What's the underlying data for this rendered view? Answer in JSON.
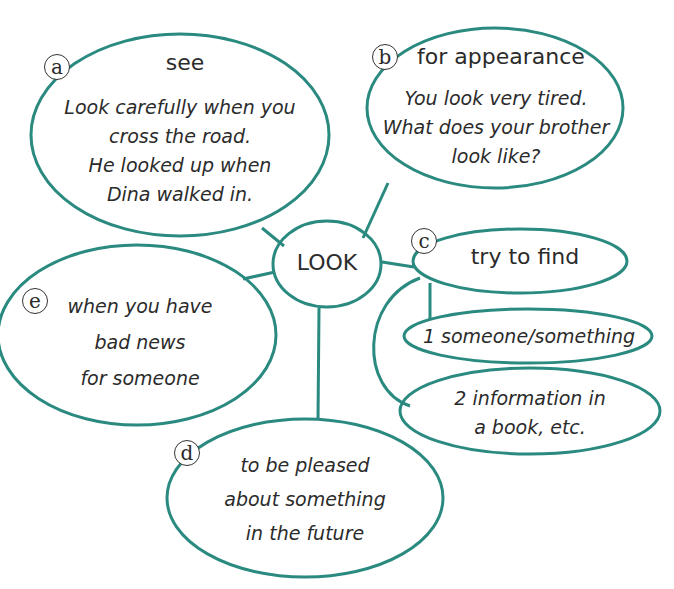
{
  "diagram": {
    "colors": {
      "stroke": "#2a8a80",
      "text": "#2b2b2b",
      "badge_border": "#333333"
    },
    "center": {
      "label": "LOOK"
    },
    "nodes": {
      "a": {
        "badge": "a",
        "heading": "see",
        "lines": [
          "Look carefully when you",
          "cross the road.",
          "He looked up when",
          "Dina walked in."
        ]
      },
      "b": {
        "badge": "b",
        "heading": "for appearance",
        "lines": [
          "You look very tired.",
          "What does your brother",
          "look like?"
        ]
      },
      "c": {
        "badge": "c",
        "heading": "try to find",
        "sub": [
          {
            "lines": [
              "1  someone/something"
            ]
          },
          {
            "lines": [
              "2  information in",
              "a book, etc."
            ]
          }
        ]
      },
      "d": {
        "badge": "d",
        "lines": [
          "to be pleased",
          "about something",
          "in the future"
        ]
      },
      "e": {
        "badge": "e",
        "lines": [
          "when you have",
          "bad news",
          "for someone"
        ]
      }
    }
  }
}
